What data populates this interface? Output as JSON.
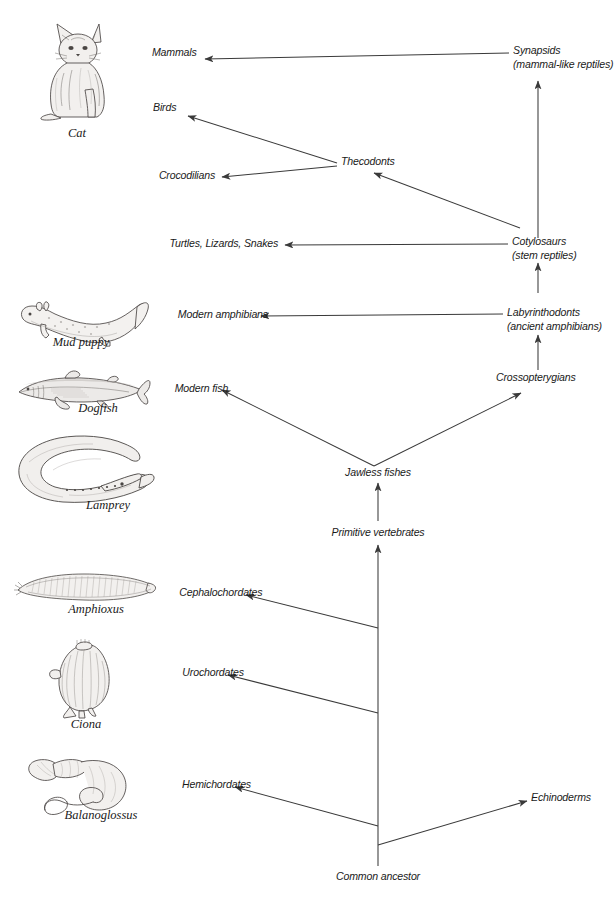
{
  "diagram": {
    "line_color": "#3a3a3a",
    "text_color": "#1a1a1a",
    "background": "#ffffff"
  },
  "taxa": [
    {
      "id": "mammals",
      "label": "Mammals",
      "sub": ""
    },
    {
      "id": "synapsids",
      "label": "Synapsids",
      "sub": "(mammal-like reptiles)"
    },
    {
      "id": "birds",
      "label": "Birds",
      "sub": ""
    },
    {
      "id": "thecodonts",
      "label": "Thecodonts",
      "sub": ""
    },
    {
      "id": "crocodilians",
      "label": "Crocodilians",
      "sub": ""
    },
    {
      "id": "turtles",
      "label": "Turtles, Lizards, Snakes",
      "sub": ""
    },
    {
      "id": "cotylosaurs",
      "label": "Cotylosaurs",
      "sub": "(stem reptiles)"
    },
    {
      "id": "modamphibians",
      "label": "Modern amphibians",
      "sub": ""
    },
    {
      "id": "labyrinthodonts",
      "label": "Labyrinthodonts",
      "sub": "(ancient amphibians)"
    },
    {
      "id": "modernfish",
      "label": "Modern fish",
      "sub": ""
    },
    {
      "id": "crossopterygians",
      "label": "Crossopterygians",
      "sub": ""
    },
    {
      "id": "jawlessfishes",
      "label": "Jawless fishes",
      "sub": ""
    },
    {
      "id": "primitivevert",
      "label": "Primitive vertebrates",
      "sub": ""
    },
    {
      "id": "cephalochordates",
      "label": "Cephalochordates",
      "sub": ""
    },
    {
      "id": "urochordates",
      "label": "Urochordates",
      "sub": ""
    },
    {
      "id": "hemichordates",
      "label": "Hemichordates",
      "sub": ""
    },
    {
      "id": "echinoderms",
      "label": "Echinoderms",
      "sub": ""
    },
    {
      "id": "commonancestor",
      "label": "Common ancestor",
      "sub": ""
    }
  ],
  "organisms": [
    {
      "id": "cat",
      "caption": "Cat"
    },
    {
      "id": "mudpuppy",
      "caption": "Mud  puppy"
    },
    {
      "id": "dogfish",
      "caption": "Dogfish"
    },
    {
      "id": "lamprey",
      "caption": "Lamprey"
    },
    {
      "id": "amphioxus",
      "caption": "Amphioxus"
    },
    {
      "id": "ciona",
      "caption": "Ciona"
    },
    {
      "id": "balanoglossus",
      "caption": "Balanoglossus"
    }
  ]
}
